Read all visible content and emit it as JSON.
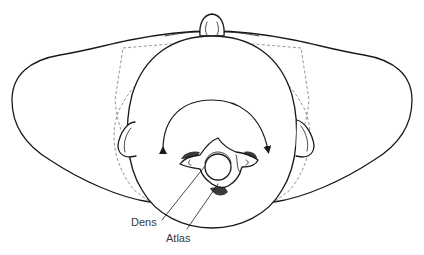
{
  "diagram": {
    "labels": {
      "dens": "Dens",
      "atlas": "Atlas"
    },
    "annotations": {
      "rotation_arrow": "bidirectional curved arrow indicating head rotation"
    },
    "colors": {
      "stroke": "#1a1a1a",
      "dashed": "#7a7a7a",
      "shade": "#3a3a3a",
      "background": "#ffffff"
    }
  }
}
